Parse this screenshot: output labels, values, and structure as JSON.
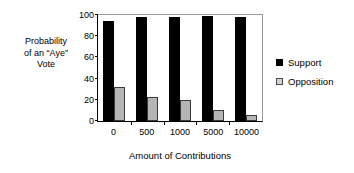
{
  "chart_data": {
    "type": "bar",
    "title": "",
    "categories": [
      "0",
      "500",
      "1000",
      "5000",
      "10000"
    ],
    "series": [
      {
        "name": "Support",
        "color": "#000000",
        "values": [
          94,
          98,
          98,
          99,
          98
        ]
      },
      {
        "name": "Opposition",
        "color": "#b5b5b5",
        "values": [
          32,
          23,
          20,
          10,
          6
        ]
      }
    ],
    "xlabel": "Amount of Contributions",
    "ylabel": "Probability of an “Aye” Vote",
    "ylabel_lines": [
      "Probability",
      "of an “Aye”",
      "Vote"
    ],
    "ylim": [
      0,
      100
    ],
    "yticks": [
      "100",
      "80",
      "60",
      "40",
      "20",
      "0"
    ],
    "ytick_values": [
      100,
      80,
      60,
      40,
      20,
      0
    ],
    "grid": false,
    "legend_position": "right",
    "legend": [
      {
        "label": "Support",
        "swatch": "black-square-icon"
      },
      {
        "label": "Opposition",
        "swatch": "gray-square-icon"
      }
    ]
  },
  "axis": {
    "y_title_line1": "Probability",
    "y_title_line2": "of an “Aye”",
    "y_title_line3": "Vote",
    "x_title": "Amount of Contributions"
  }
}
